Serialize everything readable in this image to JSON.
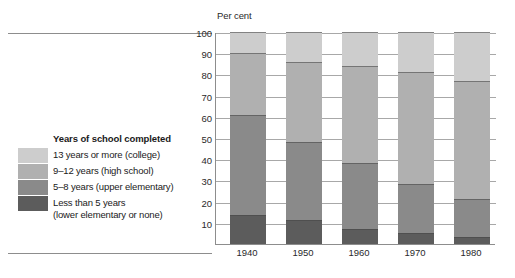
{
  "axis_title": "Per cent",
  "legend": {
    "title": "Years of school completed",
    "items": [
      {
        "label": "13 years or more (college)",
        "color": "#cdcdcd"
      },
      {
        "label": "9–12 years (high school)",
        "color": "#b0b0b0"
      },
      {
        "label": "5–8 years (upper elementary)",
        "color": "#8a8a8a"
      },
      {
        "label": "Less than 5 years\n(lower elementary or none)",
        "color": "#5c5c5c"
      }
    ]
  },
  "chart_data": {
    "type": "bar",
    "stacked": true,
    "title": "",
    "subtitle": "",
    "xlabel": "",
    "ylabel": "Per cent",
    "ylim": [
      0,
      100
    ],
    "yticks": [
      10,
      20,
      30,
      40,
      50,
      60,
      70,
      80,
      90,
      100
    ],
    "ytick_labels": [
      "10",
      "20",
      "30",
      "40",
      "50",
      "60",
      "70",
      "80",
      "90",
      "100"
    ],
    "grid": true,
    "legend_position": "left",
    "categories": [
      "1940",
      "1950",
      "1960",
      "1970",
      "1980"
    ],
    "series": [
      {
        "name": "Less than 5 years (lower elementary or none)",
        "color": "#5c5c5c",
        "values": [
          13.5,
          11.5,
          7.0,
          5.0,
          3.5
        ]
      },
      {
        "name": "5–8 years (upper elementary)",
        "color": "#8a8a8a",
        "values": [
          47.5,
          36.5,
          31.0,
          23.5,
          17.5
        ]
      },
      {
        "name": "9–12 years (high school)",
        "color": "#b0b0b0",
        "values": [
          29.0,
          38.0,
          46.0,
          52.5,
          56.0
        ]
      },
      {
        "name": "13 years or more (college)",
        "color": "#cdcdcd",
        "values": [
          10.0,
          14.0,
          16.0,
          19.0,
          23.0
        ]
      }
    ],
    "cumulative_tops": {
      "1940": [
        13.5,
        61.0,
        90.0,
        100
      ],
      "1950": [
        11.5,
        48.0,
        86.0,
        100
      ],
      "1960": [
        7.0,
        38.0,
        84.0,
        100
      ],
      "1970": [
        5.0,
        28.5,
        81.0,
        100
      ],
      "1980": [
        3.5,
        21.0,
        77.0,
        100
      ]
    }
  }
}
